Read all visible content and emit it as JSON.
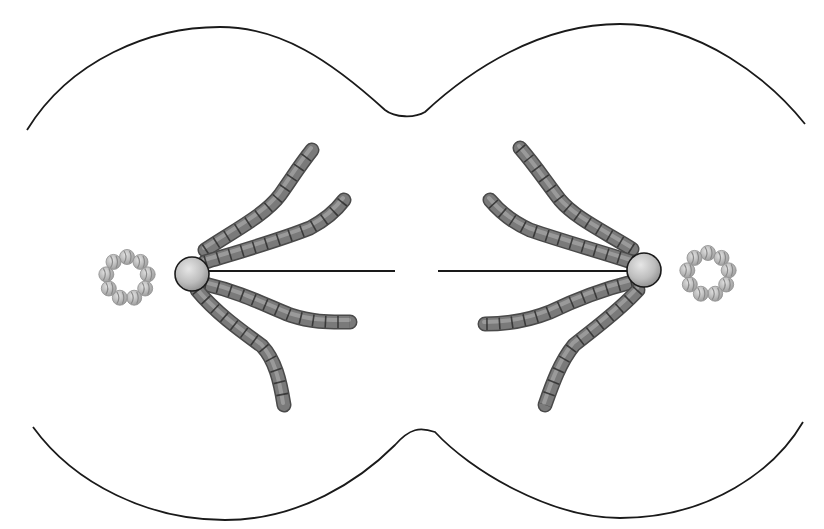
{
  "diagram": {
    "type": "cell-division-anaphase",
    "colors": {
      "background": "#ffffff",
      "outline": "#1a1a1a",
      "chromosome_fill": "#7a7a7a",
      "chromosome_dark": "#4a4a4a",
      "chromosome_light": "#a8a8a8",
      "chromosome_stripe": "#2e2e2e",
      "centrosome_fill": "#c8c8c8",
      "centrosome_edge": "#1a1a1a",
      "bead_fill": "#c4c4c4",
      "bead_stripe": "#8a8a8a",
      "spindle": "#1a1a1a"
    },
    "cell_outline": {
      "upper_path": "M27,130 C70,60 150,27 220,27 C280,27 330,60 385,110 C395,118 415,118 425,112 C470,70 540,24 620,24 C700,24 770,80 805,124",
      "lower_path": "M33,427 C75,485 150,520 225,520 C300,520 360,480 395,445 C410,428 420,427 435,432 C470,470 550,518 620,518 C710,518 775,470 803,422"
    },
    "poles": [
      {
        "side": "left",
        "centrosome": {
          "cx": 192,
          "cy": 274,
          "r": 17
        },
        "centriole_ring": {
          "cx": 127,
          "cy": 278,
          "ring_r": 21,
          "bead_r": 7.5,
          "bead_count": 9
        },
        "spindle_fiber": {
          "x1": 205,
          "y1": 271,
          "x2": 395,
          "y2": 271
        },
        "chromosomes": [
          {
            "path": "M205,250 C235,230 265,215 280,195 C292,178 300,165 312,150"
          },
          {
            "path": "M205,262 C245,250 280,240 310,228 C325,220 335,212 344,200"
          },
          {
            "path": "M205,284 C240,292 265,305 290,315 C315,323 330,322 350,322"
          },
          {
            "path": "M197,290 C215,312 240,330 262,346 C275,360 280,380 284,405"
          }
        ]
      },
      {
        "side": "right",
        "centrosome": {
          "cx": 644,
          "cy": 270,
          "r": 17
        },
        "centriole_ring": {
          "cx": 708,
          "cy": 274,
          "ring_r": 21,
          "bead_r": 7.5,
          "bead_count": 9
        },
        "spindle_fiber": {
          "x1": 438,
          "y1": 271,
          "x2": 630,
          "y2": 271
        },
        "chromosomes": [
          {
            "path": "M632,249 C605,232 575,218 560,200 C546,182 535,165 520,148"
          },
          {
            "path": "M632,262 C595,250 565,242 530,230 C512,222 500,212 490,200"
          },
          {
            "path": "M632,282 C600,290 575,300 550,312 C525,322 505,324 485,324"
          },
          {
            "path": "M638,290 C618,312 595,328 574,345 C560,362 552,385 545,405"
          }
        ]
      }
    ]
  }
}
